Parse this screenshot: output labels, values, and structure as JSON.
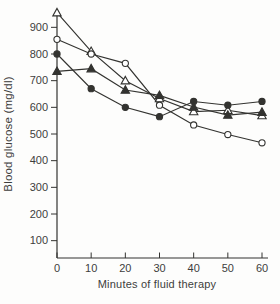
{
  "chart_data": {
    "type": "line",
    "title": "",
    "xlabel": "Minutes of fluid therapy",
    "ylabel": "Blood glucose (mg/dl)",
    "x": [
      0,
      10,
      20,
      30,
      40,
      50,
      60
    ],
    "x_ticks": [
      0,
      10,
      20,
      30,
      40,
      50,
      60
    ],
    "y_ticks": [
      100,
      200,
      300,
      400,
      500,
      600,
      700,
      800,
      900
    ],
    "xlim": [
      0,
      60
    ],
    "ylim": [
      35,
      965
    ],
    "grid": false,
    "legend_position": "none",
    "series": [
      {
        "name": "open-triangle",
        "marker": "triangle-open",
        "values": [
          955,
          810,
          700,
          633,
          584,
          589,
          569
        ]
      },
      {
        "name": "open-circle",
        "marker": "circle-open",
        "values": [
          855,
          800,
          765,
          608,
          534,
          498,
          467
        ]
      },
      {
        "name": "filled-circle",
        "marker": "circle-filled",
        "values": [
          800,
          670,
          600,
          565,
          622,
          608,
          622
        ]
      },
      {
        "name": "filled-triangle",
        "marker": "triangle-filled",
        "values": [
          735,
          745,
          665,
          645,
          601,
          571,
          582
        ]
      }
    ],
    "colors": {
      "line": "#333330",
      "marker_open_fill": "#ffffff",
      "text": "#3d3d3d",
      "background": "#fdfdfc"
    }
  }
}
